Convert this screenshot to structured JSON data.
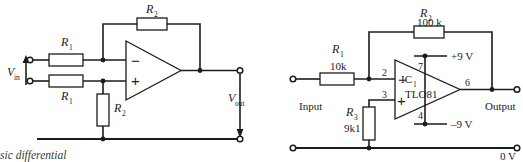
{
  "page": {
    "width": 523,
    "height": 162,
    "background": "#ffffff",
    "ink_color": "#1c1c1c"
  },
  "figures": [
    {
      "id": "basic-differential-amplifier",
      "title": "Basic differential amplifier",
      "caption_visible": "sic differential",
      "labels": {
        "input": "V",
        "input_sub": "in",
        "output": "V",
        "output_sub": "out",
        "r_feedback": "R",
        "r_feedback_sub": "2",
        "r_in_top": "R",
        "r_in_top_sub": "1",
        "r_in_bottom": "R",
        "r_in_bottom_sub": "1",
        "r_ground": "R",
        "r_ground_sub": "2",
        "opamp_minus": "−",
        "opamp_plus": "+"
      }
    },
    {
      "id": "tl081-inverting-amplifier",
      "title": "TL081 inverting amplifier",
      "labels": {
        "input": "Input",
        "output": "Output",
        "rail_zero": "0 V",
        "rail_pos": "+9 V",
        "rail_neg": "–9 V",
        "r_feedback": "R",
        "r_feedback_sub": "2",
        "r_feedback_value": "100 k",
        "r_input": "R",
        "r_input_sub": "1",
        "r_input_value": "10k",
        "r_bias": "R",
        "r_bias_sub": "3",
        "r_bias_value": "9k1",
        "ic_ref": "IC",
        "ic_ref_sub": "1",
        "ic_part": "TLO81",
        "pin_inverting": "2",
        "pin_noninverting": "3",
        "pin_vpos": "7",
        "pin_vneg": "4",
        "pin_output": "6",
        "opamp_minus": "−",
        "opamp_plus": "+"
      }
    }
  ]
}
